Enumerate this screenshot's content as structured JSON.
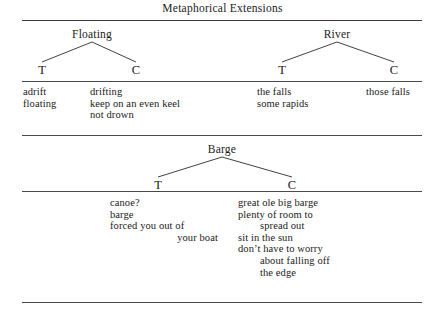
{
  "figure": {
    "title": "Metaphorical Extensions",
    "sections": [
      {
        "name": "top",
        "trees": [
          {
            "root": "Floating",
            "left_child": "T",
            "right_child": "C",
            "left_items": [
              "adrift",
              "floating"
            ],
            "right_items": [
              "drifting",
              "keep on an even keel",
              "not drown"
            ]
          },
          {
            "root": "River",
            "left_child": "T",
            "right_child": "C",
            "left_items": [
              "the falls",
              "some rapids"
            ],
            "right_items": [
              "those falls"
            ]
          }
        ]
      },
      {
        "name": "bottom",
        "trees": [
          {
            "root": "Barge",
            "left_child": "T",
            "right_child": "C",
            "left_items": [
              "canoe?",
              "barge",
              "forced you out of",
              "your boat"
            ],
            "right_items": [
              "great ole big barge",
              "plenty of room to",
              "spread out",
              "sit in the sun",
              "don’t have to worry",
              "about falling off",
              "the edge"
            ]
          }
        ]
      }
    ],
    "rule_color": "#4a4a4a"
  }
}
